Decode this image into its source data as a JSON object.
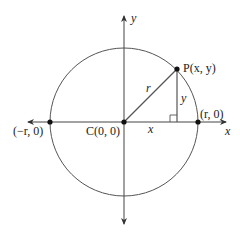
{
  "diagram": {
    "title": "",
    "colors": {
      "stroke": "#555555",
      "point": "#111111",
      "text": "#222222",
      "background": "#ffffff"
    },
    "center": {
      "cx": 124,
      "cy": 122,
      "r": 74
    },
    "axes": {
      "x_label": "x",
      "y_label": "y"
    },
    "points": {
      "center": {
        "label": "C(0, 0)"
      },
      "p": {
        "label": "P(x, y)"
      },
      "right": {
        "label": "(r, 0)"
      },
      "left": {
        "label": "(−r, 0)"
      }
    },
    "segments": {
      "radius_label": "r",
      "horizontal_leg_label": "x",
      "vertical_leg_label": "y"
    }
  }
}
